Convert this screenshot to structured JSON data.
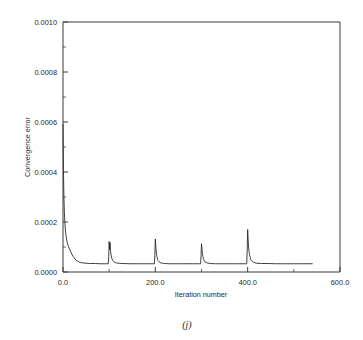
{
  "figure": {
    "caption": "(j)",
    "background_color": "#ffffff",
    "line_color": "#2a2a2a",
    "axis_color": "#3a3a3a"
  },
  "chart_data": {
    "type": "line",
    "title": "",
    "xlabel": "Iteration number",
    "ylabel": "Convergence error",
    "xlim": [
      0,
      600
    ],
    "ylim": [
      0,
      0.001
    ],
    "grid": false,
    "legend": null,
    "x_tick_labels": [
      "0.0",
      "200.0",
      "400.0",
      "600.0"
    ],
    "x_tick_values": [
      0,
      200,
      400,
      600
    ],
    "x_minor_ticks": [
      100,
      300,
      500
    ],
    "y_tick_labels": [
      "0.0000",
      "0.0002",
      "0.0004",
      "0.0006",
      "0.0008",
      "0.0010"
    ],
    "y_tick_values": [
      0,
      0.0002,
      0.0004,
      0.0006,
      0.0008,
      0.001
    ],
    "y_minor_ticks": [
      0.0001,
      0.0003,
      0.0005,
      0.0007,
      0.0009
    ],
    "series": [
      {
        "name": "convergence error",
        "x": [
          0,
          1,
          2,
          3,
          4,
          5,
          6,
          7,
          8,
          9,
          10,
          11,
          12,
          13,
          14,
          15,
          16,
          17,
          18,
          19,
          20,
          22,
          24,
          26,
          28,
          30,
          35,
          40,
          45,
          50,
          60,
          70,
          80,
          90,
          95,
          98,
          99,
          100,
          101,
          102,
          103,
          104,
          105,
          106,
          108,
          110,
          113,
          116,
          120,
          130,
          145,
          160,
          180,
          195,
          198,
          199,
          200,
          201,
          202,
          203,
          204,
          205,
          206,
          208,
          210,
          213,
          216,
          220,
          230,
          245,
          260,
          280,
          295,
          298,
          299,
          300,
          301,
          302,
          303,
          304,
          305,
          306,
          308,
          310,
          313,
          316,
          320,
          330,
          345,
          360,
          380,
          395,
          398,
          399,
          400,
          401,
          402,
          403,
          404,
          405,
          406,
          408,
          410,
          413,
          416,
          420,
          430,
          445,
          460,
          480,
          500,
          520,
          540
        ],
        "y": [
          0.00059,
          0.000405,
          0.0003,
          0.000238,
          0.000198,
          0.000172,
          0.000153,
          0.000139,
          0.000128,
          0.000119,
          0.000112,
          0.000106,
          0.000101,
          9.6e-05,
          9.2e-05,
          8.8e-05,
          8.4e-05,
          8e-05,
          7.6e-05,
          7.2e-05,
          6.8e-05,
          6.2e-05,
          5.7e-05,
          5.2e-05,
          4.8e-05,
          4.5e-05,
          4e-05,
          3.7e-05,
          3.6e-05,
          3.5e-05,
          3.4e-05,
          3.4e-05,
          3.3e-05,
          3.3e-05,
          3.3e-05,
          3.3e-05,
          6.2e-05,
          0.000122,
          9e-05,
          0.000118,
          8.2e-05,
          7e-05,
          6e-05,
          5.3e-05,
          4.5e-05,
          4.1e-05,
          3.8e-05,
          3.6e-05,
          3.5e-05,
          3.4e-05,
          3.3e-05,
          3.3e-05,
          3.3e-05,
          3.3e-05,
          3.3e-05,
          7e-05,
          0.000132,
          0.000102,
          8e-05,
          6.6e-05,
          5.7e-05,
          5e-05,
          4.6e-05,
          4.1e-05,
          3.8e-05,
          3.6e-05,
          3.5e-05,
          3.4e-05,
          3.3e-05,
          3.3e-05,
          3.3e-05,
          3.3e-05,
          3.3e-05,
          3.3e-05,
          6.5e-05,
          0.000113,
          9.3e-05,
          7.5e-05,
          6.3e-05,
          5.5e-05,
          4.9e-05,
          4.5e-05,
          4e-05,
          3.8e-05,
          3.6e-05,
          3.5e-05,
          3.4e-05,
          3.3e-05,
          3.3e-05,
          3.3e-05,
          3.3e-05,
          3.3e-05,
          3.3e-05,
          8.8e-05,
          0.00017,
          0.000128,
          0.0001,
          8.2e-05,
          7e-05,
          6.1e-05,
          5.4e-05,
          4.6e-05,
          4.2e-05,
          3.9e-05,
          3.7e-05,
          3.5e-05,
          3.4e-05,
          3.4e-05,
          3.3e-05,
          3.3e-05,
          3.3e-05,
          3.3e-05,
          3.3e-05
        ]
      }
    ]
  }
}
